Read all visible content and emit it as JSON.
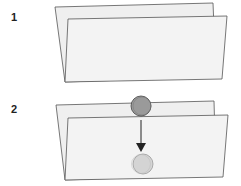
{
  "steps": [
    {
      "label": "1",
      "description": "folded paper"
    },
    {
      "label": "2",
      "description": "folded paper with coin moving down"
    }
  ],
  "colors": {
    "paper_fill": "#efefef",
    "paper_stroke": "#555555",
    "coin_top": "#9a9a9a",
    "coin_bottom": "#d4d4d4",
    "arrow": "#222222"
  }
}
